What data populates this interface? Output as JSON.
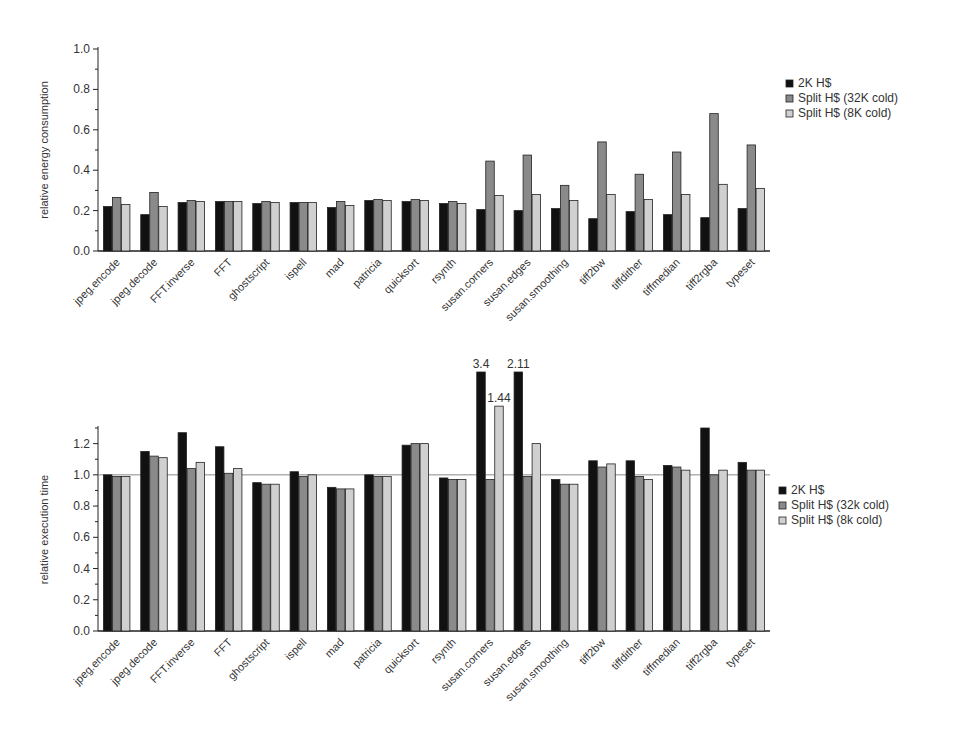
{
  "chart_data": [
    {
      "type": "bar",
      "title": "",
      "xlabel": "",
      "ylabel": "relative energy consumption",
      "ylim": [
        0,
        1.0
      ],
      "yticks": [
        "0.0",
        "0.2",
        "0.4",
        "0.6",
        "0.8",
        "1.0"
      ],
      "grid": false,
      "legend_position": "right-top",
      "categories": [
        "jpeg.encode",
        "jpeg.decode",
        "FFT.inverse",
        "FFT",
        "ghostscript",
        "ispell",
        "mad",
        "patricia",
        "quicksort",
        "rsynth",
        "susan.corners",
        "susan.edges",
        "susan.smoothing",
        "tiff2bw",
        "tiffdither",
        "tiffmedian",
        "tiff2rgba",
        "typeset"
      ],
      "series": [
        {
          "name": "2K H$",
          "color": "#111111",
          "values": [
            0.22,
            0.18,
            0.24,
            0.245,
            0.235,
            0.24,
            0.215,
            0.25,
            0.245,
            0.235,
            0.205,
            0.2,
            0.21,
            0.16,
            0.195,
            0.18,
            0.165,
            0.21
          ]
        },
        {
          "name": "Split H$ (32K cold)",
          "color": "#8a8a8a",
          "values": [
            0.265,
            0.29,
            0.25,
            0.245,
            0.245,
            0.24,
            0.245,
            0.255,
            0.255,
            0.245,
            0.445,
            0.475,
            0.325,
            0.54,
            0.38,
            0.49,
            0.68,
            0.525
          ]
        },
        {
          "name": "Split H$ (8K cold)",
          "color": "#d0d0d0",
          "values": [
            0.23,
            0.22,
            0.245,
            0.245,
            0.24,
            0.24,
            0.225,
            0.25,
            0.25,
            0.235,
            0.275,
            0.28,
            0.25,
            0.28,
            0.255,
            0.28,
            0.33,
            0.31
          ]
        }
      ]
    },
    {
      "type": "bar",
      "title": "",
      "xlabel": "",
      "ylabel": "relative execution time",
      "ylim": [
        0,
        1.3
      ],
      "yticks": [
        "0.0",
        "0.2",
        "0.4",
        "0.6",
        "0.8",
        "1.0",
        "1.2"
      ],
      "reference_line": 1.0,
      "grid": false,
      "legend_position": "right-middle",
      "annotations": [
        {
          "text": "3.4",
          "category": "susan.corners",
          "series": "2K H$"
        },
        {
          "text": "1.44",
          "category": "susan.corners",
          "series": "Split H$ (8k cold)"
        },
        {
          "text": "2.11",
          "category": "susan.edges",
          "series": "2K H$"
        }
      ],
      "categories": [
        "jpeg.encode",
        "jpeg.decode",
        "FFT.inverse",
        "FFT",
        "ghostscript",
        "ispell",
        "mad",
        "patricia",
        "quicksort",
        "rsynth",
        "susan.corners",
        "susan.edges",
        "susan.smoothing",
        "tiff2bw",
        "tiffdither",
        "tiffmedian",
        "tiff2rgba",
        "typeset"
      ],
      "series": [
        {
          "name": "2K H$",
          "color": "#111111",
          "values": [
            1.0,
            1.15,
            1.27,
            1.18,
            0.95,
            1.02,
            0.92,
            1.0,
            1.19,
            0.98,
            3.4,
            2.11,
            0.97,
            1.09,
            1.09,
            1.06,
            1.3,
            1.08
          ]
        },
        {
          "name": "Split H$ (32k cold)",
          "color": "#8a8a8a",
          "values": [
            0.99,
            1.12,
            1.04,
            1.01,
            0.94,
            0.99,
            0.91,
            0.99,
            1.2,
            0.97,
            0.97,
            0.99,
            0.94,
            1.05,
            0.99,
            1.05,
            1.0,
            1.03
          ]
        },
        {
          "name": "Split H$ (8k cold)",
          "color": "#d0d0d0",
          "values": [
            0.99,
            1.11,
            1.08,
            1.04,
            0.94,
            1.0,
            0.91,
            0.99,
            1.2,
            0.97,
            1.44,
            1.2,
            0.94,
            1.07,
            0.97,
            1.03,
            1.03,
            1.03
          ]
        }
      ]
    }
  ]
}
